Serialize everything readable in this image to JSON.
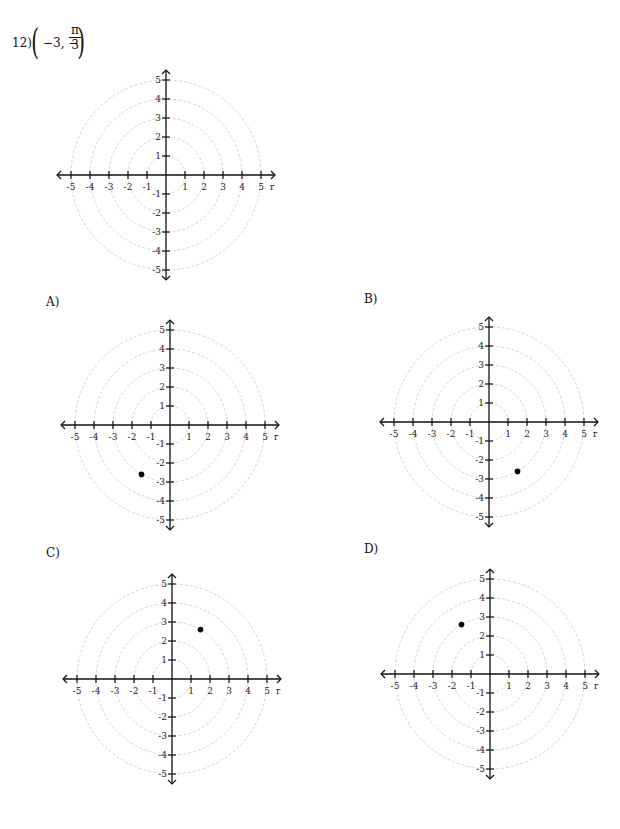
{
  "question": {
    "number": "12)",
    "coord_prefix": "−3, −",
    "frac_num": "π",
    "frac_den": "3"
  },
  "axis": {
    "r_label": "r",
    "ticks": [
      -5,
      -4,
      -3,
      -2,
      -1,
      1,
      2,
      3,
      4,
      5
    ]
  },
  "choices": [
    {
      "label": "A)",
      "point": {
        "x": -1.5,
        "y": -2.6
      }
    },
    {
      "label": "B)",
      "point": {
        "x": 1.5,
        "y": -2.6
      }
    },
    {
      "label": "C)",
      "point": {
        "x": 1.5,
        "y": 2.6
      }
    },
    {
      "label": "D)",
      "point": {
        "x": -1.5,
        "y": 2.6
      }
    }
  ],
  "colors": {
    "grid": "#c8c8c8",
    "axis": "#111111",
    "point": "#000000"
  },
  "chart_data": [
    {
      "type": "scatter",
      "title": "12) (-3, -π/3)",
      "role": "blank polar grid",
      "xlim": [
        -5,
        5
      ],
      "ylim": [
        -5,
        5
      ],
      "grid_circles": [
        1,
        2,
        3,
        4,
        5
      ],
      "points": []
    },
    {
      "type": "scatter",
      "title": "A)",
      "xlim": [
        -5,
        5
      ],
      "ylim": [
        -5,
        5
      ],
      "grid_circles": [
        1,
        2,
        3,
        4,
        5
      ],
      "points": [
        {
          "x": -1.5,
          "y": -2.6
        }
      ]
    },
    {
      "type": "scatter",
      "title": "B)",
      "xlim": [
        -5,
        5
      ],
      "ylim": [
        -5,
        5
      ],
      "grid_circles": [
        1,
        2,
        3,
        4,
        5
      ],
      "points": [
        {
          "x": 1.5,
          "y": -2.6
        }
      ]
    },
    {
      "type": "scatter",
      "title": "C)",
      "xlim": [
        -5,
        5
      ],
      "ylim": [
        -5,
        5
      ],
      "grid_circles": [
        1,
        2,
        3,
        4,
        5
      ],
      "points": [
        {
          "x": 1.5,
          "y": 2.6
        }
      ]
    },
    {
      "type": "scatter",
      "title": "D)",
      "xlim": [
        -5,
        5
      ],
      "ylim": [
        -5,
        5
      ],
      "grid_circles": [
        1,
        2,
        3,
        4,
        5
      ],
      "points": [
        {
          "x": -1.5,
          "y": 2.6
        }
      ]
    }
  ]
}
